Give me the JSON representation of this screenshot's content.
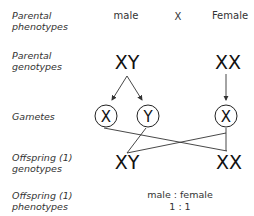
{
  "row_labels": {
    "parental_phenotypes": [
      "Parental",
      "phenotypes"
    ],
    "parental_genotypes": [
      "Parental",
      "genotypes"
    ],
    "gametes": [
      "Gametes"
    ],
    "offspring_genotypes": [
      "Offspring (1)",
      "genotypes"
    ],
    "offspring_phenotypes": [
      "Offspring (1)",
      "phenotypes"
    ]
  },
  "parents": {
    "male_label": "male",
    "cross_symbol": "X",
    "female_label": "Female",
    "male_genotype": "XY",
    "female_genotype": "XX"
  },
  "gametes": [
    {
      "allele": "X",
      "from": "male"
    },
    {
      "allele": "Y",
      "from": "male"
    },
    {
      "allele": "X",
      "from": "female"
    }
  ],
  "offspring": {
    "genotypes": [
      "XY",
      "XX"
    ],
    "phenotype_ratio_label": "male : female",
    "phenotype_ratio_value": "1 : 1"
  },
  "colors": {
    "line": "#333333",
    "text": "#1a1a1a",
    "label": "#333333"
  }
}
